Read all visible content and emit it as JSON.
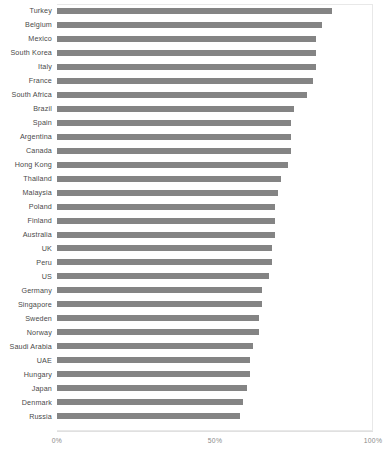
{
  "chart_data": {
    "type": "bar",
    "orientation": "horizontal",
    "title": "",
    "subtitle": "",
    "xlabel": "",
    "ylabel": "",
    "xlim": [
      0,
      100
    ],
    "grid": false,
    "legend": null,
    "bar_color": "#848484",
    "axis_tick_labels": [
      "0%",
      "50%",
      "100%"
    ],
    "axis_tick_values": [
      0,
      50,
      100
    ],
    "value_unit": "%",
    "categories": [
      "Turkey",
      "Belgium",
      "Mexico",
      "South Korea",
      "Italy",
      "France",
      "South Africa",
      "Brazil",
      "Spain",
      "Argentina",
      "Canada",
      "Hong Kong",
      "Thailand",
      "Malaysia",
      "Poland",
      "Finland",
      "Australia",
      "UK",
      "Peru",
      "US",
      "Germany",
      "Singapore",
      "Sweden",
      "Norway",
      "Saudi Arabia",
      "UAE",
      "Hungary",
      "Japan",
      "Denmark",
      "Russia"
    ],
    "values": [
      87,
      84,
      82,
      82,
      82,
      81,
      79,
      75,
      74,
      74,
      74,
      73,
      71,
      70,
      69,
      69,
      69,
      68,
      68,
      67,
      65,
      65,
      64,
      64,
      62,
      61,
      61,
      60,
      59,
      58
    ]
  }
}
